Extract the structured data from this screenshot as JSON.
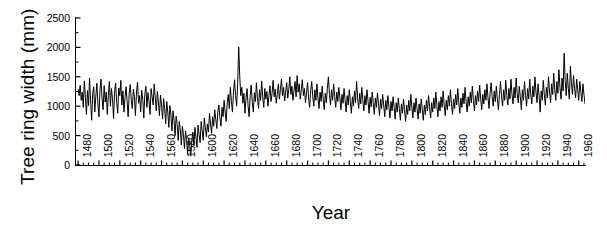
{
  "chart_data": {
    "type": "line",
    "title": "",
    "xlabel": "Year",
    "ylabel": "Tree ring width (mm)",
    "xlim": [
      1478,
      1966
    ],
    "ylim": [
      0,
      2500
    ],
    "ytick_values": [
      0,
      500,
      1000,
      1500,
      2000,
      2500
    ],
    "ytick_labels": [
      "0",
      "500",
      "1000",
      "1500",
      "2000",
      "2500"
    ],
    "y_minor_interval": 250,
    "xtick_values": [
      1480,
      1500,
      1520,
      1540,
      1560,
      1580,
      1600,
      1620,
      1640,
      1660,
      1680,
      1700,
      1720,
      1740,
      1760,
      1780,
      1800,
      1820,
      1840,
      1860,
      1880,
      1900,
      1920,
      1940,
      1960
    ],
    "xtick_labels": [
      "1480",
      "1500",
      "1520",
      "1540",
      "1560",
      "1580",
      "1600",
      "1620",
      "1640",
      "1660",
      "1680",
      "1700",
      "1720",
      "1740",
      "1760",
      "1780",
      "1800",
      "1820",
      "1840",
      "1860",
      "1880",
      "1900",
      "1920",
      "1940",
      "1960"
    ],
    "x_minor_interval": 5,
    "grid": false,
    "legend": null,
    "line_color": "#000000",
    "line_width": 1.0,
    "series_name": "Tree ring width",
    "x_start": 1480,
    "x_step": 1,
    "values": [
      1290,
      1180,
      1355,
      1100,
      1240,
      980,
      1430,
      1150,
      860,
      1265,
      1010,
      1480,
      1090,
      760,
      1220,
      1330,
      900,
      1170,
      1390,
      1040,
      820,
      1285,
      1460,
      1120,
      940,
      1350,
      1070,
      1240,
      860,
      1180,
      1420,
      1000,
      1300,
      1130,
      790,
      1240,
      1395,
      1060,
      880,
      1310,
      1180,
      1440,
      1020,
      1260,
      900,
      1150,
      1330,
      1080,
      820,
      1220,
      1370,
      1100,
      960,
      1290,
      1160,
      840,
      1240,
      1410,
      1050,
      1180,
      900,
      1270,
      1120,
      800,
      1200,
      1340,
      980,
      1230,
      1090,
      860,
      1300,
      1160,
      1020,
      1380,
      1140,
      920,
      1250,
      1070,
      840,
      1190,
      1020,
      780,
      1130,
      960,
      700,
      1080,
      900,
      640,
      1010,
      860,
      580,
      920,
      760,
      500,
      830,
      690,
      420,
      740,
      600,
      340,
      660,
      520,
      280,
      580,
      430,
      190,
      460,
      330,
      150,
      400,
      560,
      330,
      640,
      480,
      300,
      680,
      520,
      380,
      740,
      580,
      420,
      800,
      640,
      480,
      700,
      560,
      880,
      700,
      540,
      820,
      660,
      940,
      780,
      620,
      900,
      1020,
      800,
      660,
      980,
      820,
      1100,
      900,
      740,
      1060,
      1200,
      960,
      1320,
      1080,
      900,
      1240,
      1450,
      1180,
      1000,
      1380,
      2010,
      1500,
      1180,
      1320,
      1050,
      1220,
      880,
      1140,
      1300,
      1000,
      820,
      1180,
      1360,
      1060,
      900,
      1230,
      1080,
      1400,
      1140,
      960,
      1280,
      1100,
      1430,
      1160,
      980,
      1300,
      1120,
      1250,
      1000,
      1180,
      1350,
      1080,
      1220,
      1440,
      1160,
      1290,
      1050,
      1200,
      1380,
      1120,
      1280,
      1460,
      1180,
      1320,
      1090,
      1240,
      1400,
      1140,
      1280,
      1500,
      1200,
      1340,
      1100,
      1260,
      1420,
      1160,
      1520,
      1240,
      1380,
      1120,
      1280,
      1450,
      1180,
      1300,
      1060,
      1220,
      1400,
      1140,
      980,
      1260,
      1420,
      1160,
      1000,
      1280,
      1100,
      1380,
      1140,
      960,
      1240,
      1080,
      1340,
      1120,
      940,
      1220,
      1060,
      1300,
      1500,
      1200,
      1020,
      1280,
      1100,
      1380,
      1160,
      980,
      1240,
      1080,
      1320,
      1140,
      940,
      1200,
      1050,
      1300,
      1100,
      900,
      1180,
      1020,
      1280,
      1080,
      880,
      1160,
      1000,
      1260,
      1060,
      1420,
      1140,
      960,
      1220,
      1040,
      1320,
      1100,
      920,
      1180,
      1020,
      1280,
      1080,
      880,
      1150,
      990,
      1240,
      1060,
      860,
      1140,
      980,
      1220,
      1040,
      840,
      1120,
      960,
      1200,
      1020,
      820,
      1100,
      940,
      1180,
      1000,
      800,
      1080,
      920,
      1160,
      980,
      780,
      1060,
      900,
      1140,
      960,
      760,
      1040,
      880,
      1120,
      940,
      740,
      1020,
      860,
      1100,
      920,
      1200,
      980,
      800,
      1060,
      900,
      1140,
      960,
      780,
      1040,
      880,
      1120,
      940,
      760,
      1020,
      860,
      1100,
      920,
      1180,
      980,
      800,
      1060,
      900,
      1140,
      960,
      1240,
      1000,
      820,
      1080,
      920,
      1160,
      980,
      1260,
      1020,
      840,
      1100,
      940,
      1180,
      1000,
      1280,
      1040,
      860,
      1120,
      960,
      1200,
      1020,
      1300,
      1060,
      880,
      1140,
      980,
      1220,
      1040,
      1320,
      1080,
      900,
      1160,
      1000,
      1240,
      1060,
      1340,
      1100,
      920,
      1180,
      1020,
      1260,
      1080,
      1360,
      1120,
      940,
      1200,
      1040,
      1280,
      1100,
      1380,
      1140,
      960,
      1220,
      1400,
      1160,
      1000,
      1260,
      1080,
      1340,
      1120,
      940,
      1200,
      1420,
      1160,
      1000,
      1280,
      1100,
      1440,
      1180,
      1020,
      1300,
      1120,
      1460,
      1200,
      1040,
      1320,
      1140,
      1480,
      1220,
      1060,
      1340,
      1160,
      940,
      1280,
      1100,
      1420,
      1180,
      1000,
      1300,
      1120,
      1460,
      1200,
      1040,
      1340,
      1160,
      1500,
      1240,
      1060,
      1380,
      1180,
      900,
      1260,
      1100,
      1440,
      1200,
      1020,
      1320,
      1140,
      1500,
      1240,
      1060,
      1380,
      1200,
      1560,
      1280,
      1100,
      1420,
      1220,
      1620,
      1320,
      1120,
      1480,
      1260,
      1900,
      1440,
      1180,
      1560,
      1300,
      1120,
      1680,
      1380,
      1200,
      1520,
      1300,
      1140,
      1460,
      1280,
      1100,
      1420,
      1250,
      1080,
      1380,
      1200,
      1040
    ]
  }
}
